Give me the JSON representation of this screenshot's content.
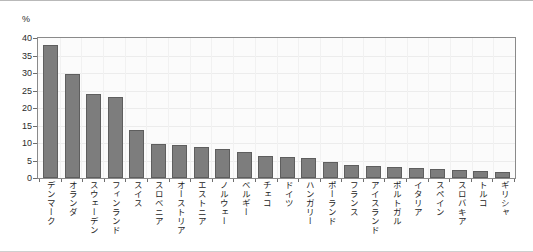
{
  "chart_data": {
    "type": "bar",
    "title": "",
    "subtitle": "",
    "xlabel": "",
    "ylabel": "%",
    "unit_label": "%",
    "ylim": [
      0,
      40
    ],
    "yticks": [
      0,
      5,
      10,
      15,
      20,
      25,
      30,
      35,
      40
    ],
    "grid": true,
    "grid_axis": "both",
    "legend": false,
    "legend_position": "none",
    "bar_color": "#7d7d7d",
    "bar_edge_color": "#5e5e5e",
    "plot_background": "#fbfbfb",
    "frame_color": "#8a8a8a",
    "categories": [
      "デンマーク",
      "オランダ",
      "スウェーデン",
      "フィンランド",
      "スイス",
      "スロベニア",
      "オーストリア",
      "エストニア",
      "ノルウェー",
      "ベルギー",
      "チェコ",
      "ドイツ",
      "ハンガリー",
      "ポーランド",
      "フランス",
      "アイスランド",
      "ポルトガル",
      "イタリア",
      "スペイン",
      "スロバキア",
      "トルコ",
      "ギリシャ"
    ],
    "values": [
      37.9,
      29.8,
      24.1,
      23.1,
      13.8,
      9.6,
      9.3,
      9.0,
      8.2,
      7.5,
      6.2,
      6.0,
      5.6,
      4.7,
      3.6,
      3.4,
      3.1,
      2.8,
      2.5,
      2.4,
      1.9,
      1.7
    ]
  }
}
